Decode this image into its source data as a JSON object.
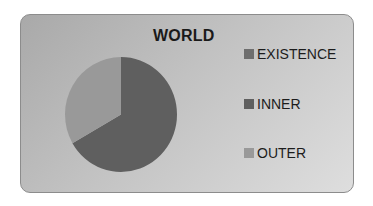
{
  "chart_data": {
    "type": "pie",
    "title": "WORLD",
    "categories": [
      "EXISTENCE",
      "INNER",
      "OUTER"
    ],
    "values": [
      0,
      66.7,
      33.3
    ],
    "colors": [
      "#6e6e6e",
      "#5f5f5f",
      "#999999"
    ],
    "legend_position": "right",
    "start_angle": 0,
    "direction": "clockwise"
  },
  "chart": {
    "title": "WORLD",
    "legend": [
      {
        "label": "EXISTENCE",
        "color": "#6e6e6e"
      },
      {
        "label": "INNER",
        "color": "#5f5f5f"
      },
      {
        "label": "OUTER",
        "color": "#999999"
      }
    ]
  }
}
